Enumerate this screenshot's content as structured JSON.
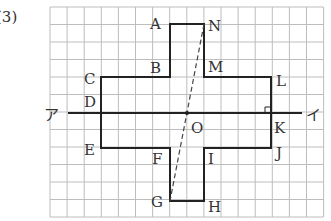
{
  "problem_number": "(3)",
  "grid": {
    "x0": 50,
    "y0": 7,
    "cols": 16,
    "rows": 12,
    "cell_w": 17.1,
    "cell_h": 17.5,
    "color": "#bbbbbb"
  },
  "axis": {
    "left_label": "ア",
    "right_label": "イ",
    "y": 113,
    "x1": 68,
    "x2": 302
  },
  "center": {
    "label": "O"
  },
  "vertices": {
    "A": "A",
    "B": "B",
    "C": "C",
    "D": "D",
    "E": "E",
    "F": "F",
    "G": "G",
    "H": "H",
    "I": "I",
    "J": "J",
    "K": "K",
    "L": "L",
    "M": "M",
    "N": "N"
  },
  "colors": {
    "outline": "#222222",
    "text": "#333333"
  }
}
